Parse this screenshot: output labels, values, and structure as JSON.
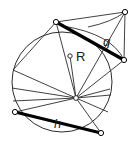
{
  "figure": {
    "kind": "geometry-diagram",
    "background_color": "#ffffff",
    "stroke_color": "#2b2b2b",
    "thick_stroke_color": "#000000",
    "vertex_fill": "#ffffff",
    "width": 135,
    "height": 152,
    "labels": {
      "chord_g": "g",
      "chord_h": "h",
      "center_r": "R"
    },
    "circle": {
      "name": "main-circle",
      "cx": 62,
      "cy": 82,
      "r": 50
    },
    "center_marker": {
      "name": "center-point",
      "cx": 70,
      "cy": 56,
      "r": 2.2,
      "label": "R",
      "label_x": 76,
      "label_y": 61
    },
    "hub": {
      "name": "hub-point",
      "cx": 76,
      "cy": 98,
      "r": 2.4
    },
    "vertices": [
      {
        "name": "vertex-top-left",
        "cx": 56,
        "cy": 22,
        "r": 2.6
      },
      {
        "name": "vertex-apex",
        "cx": 125,
        "cy": 12,
        "r": 2.6
      },
      {
        "name": "vertex-right",
        "cx": 124,
        "cy": 60,
        "r": 2.6
      },
      {
        "name": "vertex-bottom-left",
        "cx": 15,
        "cy": 112,
        "r": 2.6
      },
      {
        "name": "vertex-bottom-right",
        "cx": 101,
        "cy": 133,
        "r": 2.6
      }
    ],
    "thick_chords": [
      {
        "name": "chord-g",
        "x1": 56,
        "y1": 22,
        "x2": 124,
        "y2": 60,
        "label": "g",
        "label_x": 103,
        "label_y": 46
      },
      {
        "name": "chord-h",
        "x1": 15,
        "y1": 112,
        "x2": 101,
        "y2": 133,
        "label": "h",
        "label_x": 54,
        "label_y": 128
      }
    ],
    "thin_lines": [
      {
        "name": "line-topleft-to-apex",
        "x1": 56,
        "y1": 22,
        "x2": 125,
        "y2": 12
      },
      {
        "name": "line-apex-to-right",
        "x1": 125,
        "y1": 12,
        "x2": 124,
        "y2": 60
      },
      {
        "name": "line-apex-to-hub",
        "x1": 125,
        "y1": 12,
        "x2": 76,
        "y2": 98
      },
      {
        "name": "line-topleft-to-hub",
        "x1": 56,
        "y1": 22,
        "x2": 76,
        "y2": 98
      },
      {
        "name": "line-center-to-hub",
        "x1": 70,
        "y1": 56,
        "x2": 76,
        "y2": 98
      },
      {
        "name": "line-hub-to-right",
        "x1": 76,
        "y1": 98,
        "x2": 124,
        "y2": 60
      },
      {
        "name": "line-hub-to-bottomright",
        "x1": 76,
        "y1": 98,
        "x2": 101,
        "y2": 133
      },
      {
        "name": "line-hub-to-bottomleft",
        "x1": 76,
        "y1": 98,
        "x2": 15,
        "y2": 112
      },
      {
        "name": "line-hub-to-left-upper",
        "x1": 76,
        "y1": 98,
        "x2": 13,
        "y2": 70
      },
      {
        "name": "line-hub-to-left-mid",
        "x1": 76,
        "y1": 98,
        "x2": 12,
        "y2": 88
      },
      {
        "name": "line-hub-to-left-low",
        "x1": 76,
        "y1": 98,
        "x2": 13,
        "y2": 101
      },
      {
        "name": "line-hub-to-right-low",
        "x1": 76,
        "y1": 98,
        "x2": 111,
        "y2": 95
      },
      {
        "name": "line-hub-to-right-lower",
        "x1": 76,
        "y1": 98,
        "x2": 108,
        "y2": 112
      },
      {
        "name": "line-hub-to-rim-upper-right",
        "x1": 76,
        "y1": 98,
        "x2": 110,
        "y2": 89
      },
      {
        "name": "line-topleft-to-left-upper",
        "x1": 56,
        "y1": 22,
        "x2": 13,
        "y2": 70
      }
    ],
    "arcs": [
      {
        "name": "arc-apex-sweep",
        "d": "M 63 26 Q 112 34 124 60"
      },
      {
        "name": "arc-inner-apex",
        "d": "M 88 27 Q 112 22 125 12"
      }
    ]
  }
}
